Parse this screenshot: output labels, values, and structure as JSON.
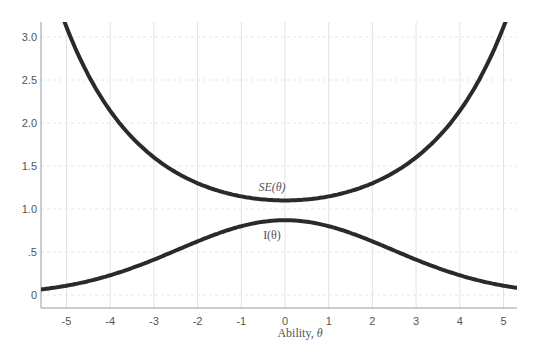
{
  "chart_data": {
    "type": "line",
    "title": "",
    "xlabel": "Ability, θ",
    "xlabel_text": "Ability, ",
    "xlabel_symbol": "θ",
    "ylabel": "",
    "xlim": [
      -5.5,
      5.3
    ],
    "ylim": [
      -0.15,
      3.2
    ],
    "grid": true,
    "legend": "none",
    "x_ticks": [
      -5,
      -4,
      -3,
      -2,
      -1,
      0,
      1,
      2,
      3,
      4,
      5
    ],
    "x_tick_labels": [
      "-5",
      "-4",
      "-3",
      "-2",
      "-1",
      "0",
      "1",
      "2",
      "3",
      "4",
      "5"
    ],
    "y_ticks": [
      0,
      0.5,
      1.0,
      1.5,
      2.0,
      2.5,
      3.0
    ],
    "y_tick_labels": [
      "0",
      ".5",
      "1.0",
      "1.5",
      "2.0",
      "2.5",
      "3.0"
    ],
    "x": [
      -5.5,
      -5,
      -4.5,
      -4,
      -3.5,
      -3,
      -2.5,
      -2,
      -1.5,
      -1,
      -0.5,
      0,
      0.5,
      1,
      1.5,
      2,
      2.5,
      3,
      3.5,
      4,
      4.5,
      5,
      5.3
    ],
    "series": [
      {
        "name": "SE(θ)",
        "values": [
          null,
          null,
          3.2,
          2.45,
          1.98,
          1.64,
          1.42,
          1.28,
          1.19,
          1.14,
          1.11,
          1.1,
          1.11,
          1.14,
          1.19,
          1.28,
          1.42,
          1.64,
          1.98,
          2.45,
          3.2,
          null,
          null
        ]
      },
      {
        "name": "I(θ)",
        "values": [
          0.05,
          0.08,
          0.12,
          0.18,
          0.26,
          0.37,
          0.49,
          0.61,
          0.72,
          0.8,
          0.85,
          0.87,
          0.85,
          0.8,
          0.72,
          0.61,
          0.49,
          0.37,
          0.26,
          0.18,
          0.12,
          0.08,
          0.07
        ]
      }
    ],
    "annotations": [
      {
        "text": "SE(θ)",
        "x": 0,
        "y": 1.26
      },
      {
        "text": "I(θ)",
        "x": 0,
        "y": 0.7
      }
    ]
  }
}
